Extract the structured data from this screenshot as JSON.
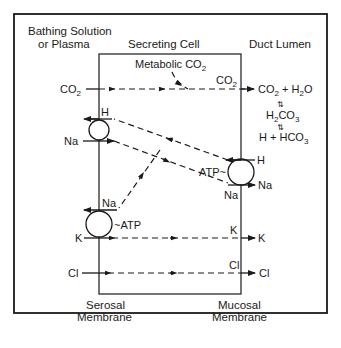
{
  "headers": {
    "bathing": [
      "Bathing Solution",
      "or Plasma"
    ],
    "cell": "Secreting Cell",
    "lumen": "Duct Lumen",
    "serosal": [
      "Serosal",
      "Membrane"
    ],
    "mucosal": [
      "Mucosal",
      "Membrane"
    ]
  },
  "labels": {
    "co2_in": "CO",
    "co2_sub": "2",
    "metabolic": "Metabolic CO",
    "co2_cell": "CO",
    "lumen_eq1_a": "CO",
    "lumen_eq1_b": " + H",
    "lumen_eq1_c": "O",
    "lumen_eq2_a": "H",
    "lumen_eq2_b": "CO",
    "lumen_eq2_sub3": "3",
    "lumen_eq3_a": "H + HCO",
    "h_left": "H",
    "na_left": "Na",
    "na_pump": "Na",
    "atp_left": "~ATP",
    "k_left": "K",
    "k_cell": "K",
    "k_right": "K",
    "cl_left": "Cl",
    "cl_cell": "Cl",
    "cl_right": "Cl",
    "atp_right": "ATP~",
    "h_right": "H",
    "na_right_in": "Na",
    "na_right_out": "Na"
  },
  "colors": {
    "ink": "#1a1a1a",
    "background": "#ffffff"
  }
}
